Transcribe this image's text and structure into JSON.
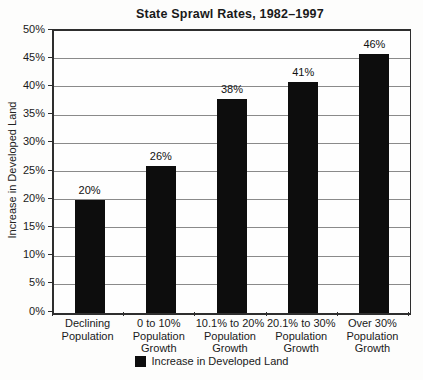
{
  "chart_data": {
    "type": "bar",
    "title": "State Sprawl Rates, 1982–1997",
    "ylabel": "Increase in Developed Land",
    "xlabel": "",
    "categories": [
      "Declining\nPopulation",
      "0 to 10%\nPopulation\nGrowth",
      "10.1% to 20%\nPopulation\nGrowth",
      "20.1% to 30%\nPopulation\nGrowth",
      "Over 30%\nPopulation\nGrowth"
    ],
    "values": [
      20,
      26,
      38,
      41,
      46
    ],
    "value_labels": [
      "20%",
      "26%",
      "38%",
      "41%",
      "46%"
    ],
    "ylim": [
      0,
      50
    ],
    "ytick_step": 5,
    "ytick_labels": [
      "0%",
      "5%",
      "10%",
      "15%",
      "20%",
      "25%",
      "30%",
      "35%",
      "40%",
      "45%",
      "50%"
    ],
    "grid": true,
    "legend": {
      "position": "bottom",
      "entries": [
        "Increase in Developed Land"
      ]
    },
    "colors": {
      "bar": "#0d0d0d",
      "gridline": "#8a8a8a",
      "axis": "#2e2e2e",
      "text": "#1a1a1a",
      "background": "#fdfdfc"
    }
  }
}
